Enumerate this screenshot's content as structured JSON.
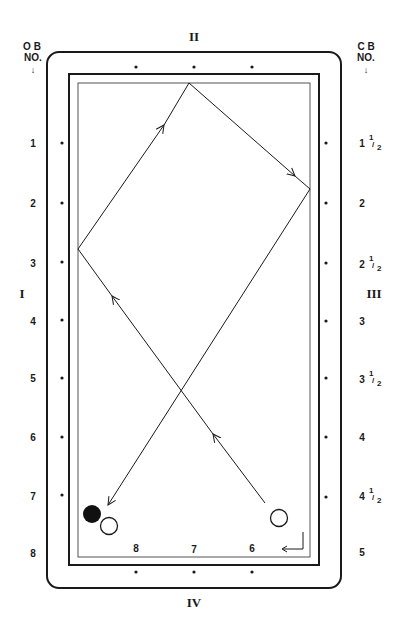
{
  "diagram": {
    "colors": {
      "ink": "#1a1a1a",
      "cushion": "#555555",
      "background": "#ffffff"
    },
    "rail_labels": {
      "left": "I",
      "top": "II",
      "right": "III",
      "bottom": "IV"
    },
    "left_header": {
      "line1": "O B",
      "line2": "NO.",
      "arrow": "↓"
    },
    "right_header": {
      "line1": "C B",
      "line2": "NO.",
      "arrow": "↓"
    },
    "left_numbers": [
      "1",
      "2",
      "3",
      "4",
      "5",
      "6",
      "7",
      "8"
    ],
    "right_numbers": [
      {
        "whole": "1",
        "frac": "1/2"
      },
      {
        "whole": "2",
        "frac": ""
      },
      {
        "whole": "2",
        "frac": "1/2"
      },
      {
        "whole": "3",
        "frac": ""
      },
      {
        "whole": "3",
        "frac": "1/2"
      },
      {
        "whole": "4",
        "frac": ""
      },
      {
        "whole": "4",
        "frac": "1/2"
      },
      {
        "whole": "5",
        "frac": ""
      }
    ],
    "bottom_numbers": [
      "8",
      "7",
      "6"
    ],
    "frac_num": "1",
    "frac_den": "2",
    "balls": [
      {
        "name": "object-ball-black",
        "cx": 92,
        "cy": 514,
        "r": 9,
        "filled": true
      },
      {
        "name": "cue-ball-near-corner",
        "cx": 109,
        "cy": 526,
        "r": 9,
        "filled": false
      },
      {
        "name": "cue-ball-start",
        "cx": 279,
        "cy": 518,
        "r": 9,
        "filled": false
      }
    ],
    "path_points": [
      [
        265,
        503
      ],
      [
        78,
        249
      ],
      [
        189,
        83
      ],
      [
        310,
        189
      ],
      [
        107,
        506
      ]
    ],
    "corner_arrow": "return-arrow"
  }
}
